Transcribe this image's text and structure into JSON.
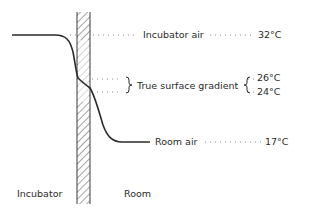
{
  "diagram": {
    "labels": {
      "incubator_air": "Incubator air",
      "incubator_air_temp": "32°C",
      "true_surface_gradient": "True surface gradient",
      "gradient_upper_temp": "26°C",
      "gradient_lower_temp": "24°C",
      "room_air": "Room air",
      "room_air_temp": "17°C",
      "incubator_side": "Incubator",
      "room_side": "Room"
    },
    "colors": {
      "line": "#2a2a2a",
      "dots": "#8a8a8a",
      "hatch": "#4a4a4a"
    }
  }
}
